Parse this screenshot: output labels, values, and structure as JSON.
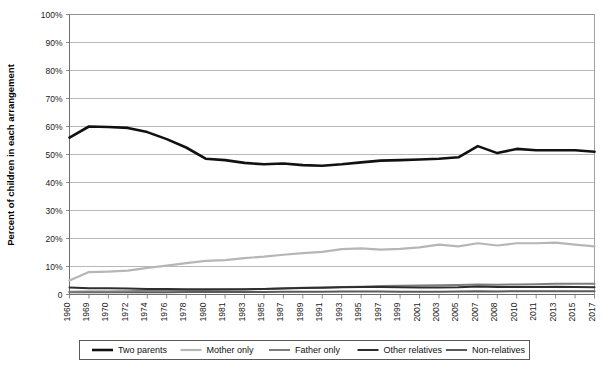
{
  "chart_data": {
    "type": "line",
    "title": "",
    "xlabel": "",
    "ylabel": "Percent of children in each arrangement",
    "ylim": [
      0,
      100
    ],
    "ytick_labels": [
      "0",
      "10%",
      "20%",
      "30%",
      "40%",
      "50%",
      "60%",
      "70%",
      "80%",
      "90%",
      "100%"
    ],
    "ytick_values": [
      0,
      10,
      20,
      30,
      40,
      50,
      60,
      70,
      80,
      90,
      100
    ],
    "grid": true,
    "legend_position": "bottom",
    "categories": [
      "1960",
      "1969",
      "1970",
      "1972",
      "1974",
      "1976",
      "1978",
      "1980",
      "1981",
      "1983",
      "1985",
      "1987",
      "1989",
      "1991",
      "1993",
      "1995",
      "1997",
      "1999",
      "2001",
      "2003",
      "2005",
      "2007",
      "2008",
      "2010",
      "2011",
      "2013",
      "2015",
      "2017"
    ],
    "x": [
      1960,
      1969,
      1970,
      1972,
      1974,
      1976,
      1978,
      1980,
      1981,
      1983,
      1985,
      1987,
      1989,
      1991,
      1993,
      1995,
      1997,
      1999,
      2001,
      2003,
      2005,
      2007,
      2008,
      2010,
      2011,
      2013,
      2015,
      2017
    ],
    "series": [
      {
        "name": "Two parents",
        "color": "#111111",
        "width": 2.6,
        "values": [
          56.0,
          60.0,
          59.8,
          59.5,
          58.0,
          55.5,
          52.5,
          48.5,
          48.0,
          47.0,
          46.5,
          46.8,
          46.2,
          46.0,
          46.5,
          47.2,
          47.8,
          48.0,
          48.2,
          48.5,
          49.0,
          53.0,
          50.5,
          52.0,
          51.5,
          51.5,
          51.5,
          51.0
        ]
      },
      {
        "name": "Mother only",
        "color": "#b6b6b6",
        "width": 2.2,
        "values": [
          5.0,
          8.0,
          8.2,
          8.5,
          9.5,
          10.3,
          11.2,
          12.0,
          12.3,
          13.0,
          13.5,
          14.2,
          14.8,
          15.2,
          16.2,
          16.5,
          16.0,
          16.3,
          16.8,
          17.8,
          17.2,
          18.3,
          17.5,
          18.3,
          18.3,
          18.5,
          17.8,
          17.2
        ]
      },
      {
        "name": "Father only",
        "color": "#7d7d7d",
        "width": 2.0,
        "values": [
          1.0,
          1.1,
          1.1,
          1.2,
          1.3,
          1.4,
          1.5,
          1.6,
          1.7,
          1.8,
          2.0,
          2.2,
          2.4,
          2.5,
          2.7,
          2.8,
          3.0,
          3.1,
          3.2,
          3.3,
          3.4,
          3.6,
          3.5,
          3.6,
          3.7,
          3.8,
          3.8,
          3.8
        ]
      },
      {
        "name": "Other relatives",
        "color": "#2e2e2e",
        "width": 2.0,
        "values": [
          2.5,
          2.2,
          2.2,
          2.1,
          2.0,
          2.0,
          1.9,
          1.9,
          1.9,
          1.9,
          2.0,
          2.1,
          2.3,
          2.4,
          2.6,
          2.7,
          2.7,
          2.6,
          2.5,
          2.5,
          2.6,
          2.9,
          2.7,
          2.7,
          2.7,
          2.8,
          2.7,
          2.6
        ]
      },
      {
        "name": "Non-relatives",
        "color": "#5a5a5a",
        "width": 2.0,
        "values": [
          0.8,
          0.8,
          0.8,
          0.8,
          0.8,
          0.8,
          0.9,
          0.9,
          0.9,
          0.9,
          0.9,
          1.0,
          1.0,
          1.0,
          1.1,
          1.1,
          1.1,
          1.0,
          1.0,
          1.0,
          1.1,
          1.2,
          1.1,
          1.2,
          1.2,
          1.2,
          1.2,
          1.2
        ]
      }
    ]
  },
  "legend": {
    "items": [
      {
        "label": "Two parents"
      },
      {
        "label": "Mother only"
      },
      {
        "label": "Father only"
      },
      {
        "label": "Other relatives"
      },
      {
        "label": "Non-relatives"
      }
    ]
  }
}
